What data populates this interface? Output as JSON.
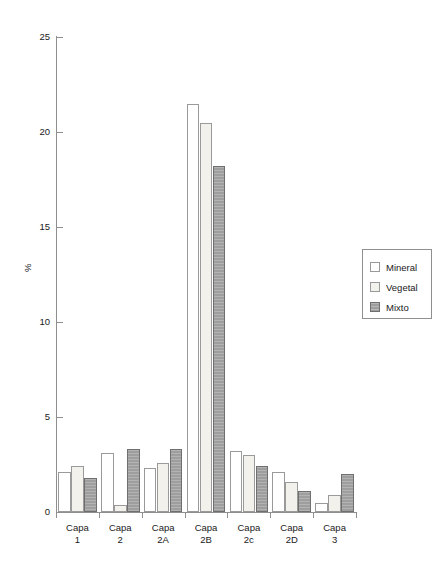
{
  "chart_data": {
    "type": "bar",
    "title": "",
    "subtitle": "",
    "xlabel": "",
    "ylabel": "%",
    "ylim": [
      0,
      25
    ],
    "yticks": [
      0,
      5,
      10,
      15,
      20,
      25
    ],
    "ytick_labels": [
      "0",
      "5",
      "10",
      "15",
      "20",
      "25"
    ],
    "grid": false,
    "legend_position": "right",
    "categories": [
      "Capa\n1",
      "Capa\n2",
      "Capa\n2A",
      "Capa\n2B",
      "Capa\n2c",
      "Capa\n2D",
      "Capa\n3"
    ],
    "category_labels": [
      {
        "line1": "Capa",
        "line2": "1"
      },
      {
        "line1": "Capa",
        "line2": "2"
      },
      {
        "line1": "Capa",
        "line2": "2A"
      },
      {
        "line1": "Capa",
        "line2": "2B"
      },
      {
        "line1": "Capa",
        "line2": "2c"
      },
      {
        "line1": "Capa",
        "line2": "2D"
      },
      {
        "line1": "Capa",
        "line2": "3"
      }
    ],
    "series": [
      {
        "name": "Mineral",
        "color": "#ffffff",
        "values": [
          2.1,
          3.1,
          2.3,
          21.5,
          3.2,
          2.1,
          0.5
        ]
      },
      {
        "name": "Vegetal",
        "color": "#f3f1ec",
        "values": [
          2.4,
          0.35,
          2.6,
          20.5,
          3.0,
          1.6,
          0.9
        ]
      },
      {
        "name": "Mixto",
        "color": "#9e9e9e",
        "values": [
          1.8,
          3.3,
          3.3,
          18.2,
          2.4,
          1.1,
          2.0
        ]
      }
    ]
  },
  "legend": {
    "items": [
      {
        "label": "Mineral",
        "swatch": "mineral"
      },
      {
        "label": "Vegetal",
        "swatch": "vegetal"
      },
      {
        "label": "Mixto",
        "swatch": "mixto"
      }
    ]
  },
  "axes": {
    "y_title": "%"
  }
}
